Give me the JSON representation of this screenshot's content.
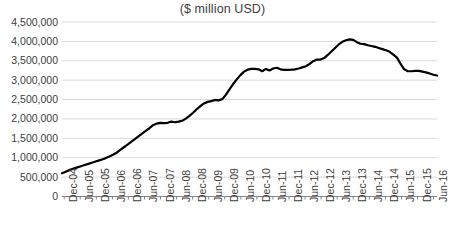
{
  "chart_data": {
    "type": "line",
    "title": "($ million USD)",
    "subtitle": "",
    "xlabel": "",
    "ylabel": "",
    "ylim": [
      0,
      4500000
    ],
    "yticks": [
      0,
      500000,
      1000000,
      1500000,
      2000000,
      2500000,
      3000000,
      3500000,
      4000000,
      4500000
    ],
    "ytick_labels": [
      "0",
      "500,000",
      "1,000,000",
      "1,500,000",
      "2,000,000",
      "2,500,000",
      "3,000,000",
      "3,500,000",
      "4,000,000",
      "4,500,000"
    ],
    "grid": true,
    "grid_axis": "y",
    "legend": false,
    "legend_position": "none",
    "line_color": "#000000",
    "line_width": 2.2,
    "grid_color": "#d9d9d9",
    "axis_color": "#868686",
    "text_color": "#404040",
    "categories": [
      "Dec-04",
      "Jun-05",
      "Dec-05",
      "Jun-06",
      "Dec-06",
      "Jun-07",
      "Dec-07",
      "Jun-08",
      "Dec-08",
      "Jun-09",
      "Dec-09",
      "Jun-10",
      "Dec-10",
      "Jun-11",
      "Dec-11",
      "Jun-12",
      "Dec-12",
      "Jun-13",
      "Dec-13",
      "Jun-14",
      "Dec-14",
      "Jun-15",
      "Dec-15",
      "Jun-16"
    ],
    "x_tick_labels": [
      "Dec-04",
      "Jun-05",
      "Dec-05",
      "Jun-06",
      "Dec-06",
      "Jun-07",
      "Dec-07",
      "Jun-08",
      "Dec-08",
      "Jun-09",
      "Dec-09",
      "Jun-10",
      "Dec-10",
      "Jun-11",
      "Dec-11",
      "Jun-12",
      "Dec-12",
      "Jun-13",
      "Dec-13",
      "Jun-14",
      "Dec-14",
      "Jun-15",
      "Dec-15",
      "Jun-16"
    ],
    "series": [
      {
        "name": "Total",
        "x": [
          "Dec-04",
          "Mar-05",
          "Jun-05",
          "Sep-05",
          "Dec-05",
          "Mar-06",
          "Jun-06",
          "Sep-06",
          "Dec-06",
          "Mar-07",
          "Jun-07",
          "Sep-07",
          "Dec-07",
          "Mar-08",
          "Jun-08",
          "Sep-08",
          "Dec-08",
          "Mar-09",
          "Jun-09",
          "Sep-09",
          "Dec-09",
          "Mar-10",
          "Jun-10",
          "Sep-10",
          "Dec-10",
          "Mar-11",
          "Jun-11",
          "Sep-11",
          "Dec-11",
          "Mar-12",
          "Jun-12",
          "Sep-12",
          "Dec-12",
          "Mar-13",
          "Jun-13",
          "Sep-13",
          "Dec-13",
          "Mar-14",
          "Jun-14",
          "Sep-14",
          "Dec-14",
          "Mar-15",
          "Jun-15",
          "Sep-15",
          "Dec-15",
          "Mar-16",
          "Jun-16",
          "Sep-16"
        ],
        "values": [
          600000,
          660000,
          720000,
          780000,
          840000,
          900000,
          960000,
          1010000,
          1080000,
          1200000,
          1320000,
          1440000,
          1560000,
          1700000,
          1870000,
          1900000,
          1880000,
          1940000,
          1930000,
          2060000,
          2250000,
          2380000,
          2450000,
          2480000,
          2500000,
          2700000,
          2980000,
          3180000,
          3280000,
          3300000,
          3270000,
          3330000,
          3260000,
          3270000,
          3280000,
          3330000,
          3450000,
          3530000,
          3560000,
          3720000,
          3900000,
          4020000,
          4050000,
          3980000,
          3900000,
          3870000,
          3800000,
          3740000
        ],
        "values_tail": [
          3650000,
          3560000,
          3260000,
          3230000,
          3230000,
          3240000,
          3200000,
          3120000
        ]
      }
    ],
    "series_points": [
      [
        0,
        600000
      ],
      [
        1,
        640000
      ],
      [
        2,
        680000
      ],
      [
        3,
        715000
      ],
      [
        4,
        745000
      ],
      [
        5,
        775000
      ],
      [
        6,
        805000
      ],
      [
        7,
        835000
      ],
      [
        8,
        865000
      ],
      [
        9,
        895000
      ],
      [
        10,
        925000
      ],
      [
        11,
        955000
      ],
      [
        12,
        990000
      ],
      [
        13,
        1030000
      ],
      [
        14,
        1075000
      ],
      [
        15,
        1130000
      ],
      [
        16,
        1200000
      ],
      [
        17,
        1270000
      ],
      [
        18,
        1340000
      ],
      [
        19,
        1410000
      ],
      [
        20,
        1480000
      ],
      [
        21,
        1550000
      ],
      [
        22,
        1620000
      ],
      [
        23,
        1690000
      ],
      [
        24,
        1760000
      ],
      [
        25,
        1840000
      ],
      [
        26,
        1880000
      ],
      [
        27,
        1900000
      ],
      [
        28,
        1890000
      ],
      [
        29,
        1900000
      ],
      [
        30,
        1930000
      ],
      [
        31,
        1915000
      ],
      [
        32,
        1930000
      ],
      [
        33,
        1950000
      ],
      [
        34,
        2010000
      ],
      [
        35,
        2080000
      ],
      [
        36,
        2160000
      ],
      [
        37,
        2250000
      ],
      [
        38,
        2330000
      ],
      [
        39,
        2400000
      ],
      [
        40,
        2440000
      ],
      [
        41,
        2460000
      ],
      [
        42,
        2490000
      ],
      [
        43,
        2480000
      ],
      [
        44,
        2510000
      ],
      [
        45,
        2620000
      ],
      [
        46,
        2760000
      ],
      [
        47,
        2900000
      ],
      [
        48,
        3020000
      ],
      [
        49,
        3130000
      ],
      [
        50,
        3220000
      ],
      [
        51,
        3270000
      ],
      [
        52,
        3290000
      ],
      [
        53,
        3290000
      ],
      [
        54,
        3280000
      ],
      [
        55,
        3230000
      ],
      [
        56,
        3290000
      ],
      [
        57,
        3250000
      ],
      [
        58,
        3300000
      ],
      [
        59,
        3320000
      ],
      [
        60,
        3280000
      ],
      [
        61,
        3265000
      ],
      [
        62,
        3265000
      ],
      [
        63,
        3270000
      ],
      [
        64,
        3280000
      ],
      [
        65,
        3300000
      ],
      [
        66,
        3330000
      ],
      [
        67,
        3360000
      ],
      [
        68,
        3420000
      ],
      [
        69,
        3490000
      ],
      [
        70,
        3530000
      ],
      [
        71,
        3530000
      ],
      [
        72,
        3570000
      ],
      [
        73,
        3650000
      ],
      [
        74,
        3740000
      ],
      [
        75,
        3830000
      ],
      [
        76,
        3920000
      ],
      [
        77,
        3990000
      ],
      [
        78,
        4030000
      ],
      [
        79,
        4050000
      ],
      [
        80,
        4040000
      ],
      [
        81,
        3980000
      ],
      [
        82,
        3940000
      ],
      [
        83,
        3930000
      ],
      [
        84,
        3900000
      ],
      [
        85,
        3880000
      ],
      [
        86,
        3860000
      ],
      [
        87,
        3830000
      ],
      [
        88,
        3800000
      ],
      [
        89,
        3770000
      ],
      [
        90,
        3730000
      ],
      [
        91,
        3660000
      ],
      [
        92,
        3580000
      ],
      [
        93,
        3420000
      ],
      [
        94,
        3280000
      ],
      [
        95,
        3230000
      ],
      [
        96,
        3230000
      ],
      [
        97,
        3240000
      ],
      [
        98,
        3240000
      ],
      [
        99,
        3220000
      ],
      [
        100,
        3200000
      ],
      [
        101,
        3170000
      ],
      [
        102,
        3140000
      ],
      [
        103,
        3120000
      ]
    ],
    "x_index_range": [
      0,
      103
    ],
    "peak": {
      "label": "Jun-14",
      "value": 4050000
    },
    "start": {
      "label": "Dec-04",
      "value": 600000
    },
    "end": {
      "label": "Sep-16",
      "value": 3120000
    }
  }
}
